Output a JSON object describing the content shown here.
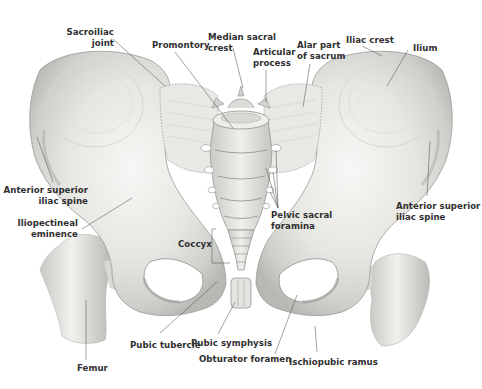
{
  "diagram": {
    "colors": {
      "bone_light": "#f4f4f2",
      "bone_mid": "#d9d9d6",
      "bone_shadow": "#a8a8a4",
      "outline": "#8a8a86",
      "label_text": "#2f2f2f",
      "leader_line": "#555555",
      "background": "#ffffff"
    },
    "labels": [
      {
        "id": "sacroiliac-joint",
        "text": "Sacroiliac\njoint",
        "x": 114,
        "y": 27,
        "align": "r",
        "line": [
          [
            113,
            39
          ],
          [
            165,
            86
          ]
        ]
      },
      {
        "id": "promontory",
        "text": "Promontory",
        "x": 152,
        "y": 40,
        "align": "l",
        "line": [
          [
            175,
            52
          ],
          [
            233,
            128
          ]
        ]
      },
      {
        "id": "median-sacral-crest",
        "text": "Median sacral\ncrest",
        "x": 208,
        "y": 32,
        "align": "l",
        "line": [
          [
            233,
            48
          ],
          [
            243,
            88
          ]
        ]
      },
      {
        "id": "articular-process",
        "text": "Articular\nprocess",
        "x": 253,
        "y": 47,
        "align": "l",
        "line": [
          [
            266,
            70
          ],
          [
            266,
            102
          ]
        ]
      },
      {
        "id": "alar-part-of-sacrum",
        "text": "Alar part\nof sacrum",
        "x": 297,
        "y": 40,
        "align": "l",
        "line": [
          [
            310,
            64
          ],
          [
            303,
            107
          ]
        ]
      },
      {
        "id": "iliac-crest",
        "text": "Iliac crest",
        "x": 346,
        "y": 35,
        "align": "l",
        "line": [
          [
            362,
            46
          ],
          [
            382,
            56
          ]
        ]
      },
      {
        "id": "ilium",
        "text": "Ilium",
        "x": 413,
        "y": 43,
        "align": "l",
        "line": [
          [
            408,
            50
          ],
          [
            387,
            86
          ]
        ]
      },
      {
        "id": "anterior-superior-iliac-spine-left",
        "text": "Anterior superior\niliac spine",
        "x": 88,
        "y": 185,
        "align": "r",
        "line": [
          [
            53,
            182
          ],
          [
            37,
            137
          ]
        ]
      },
      {
        "id": "iliopectineal-eminence",
        "text": "Iliopectineal\neminence",
        "x": 78,
        "y": 218,
        "align": "r",
        "line": [
          [
            82,
            229
          ],
          [
            132,
            198
          ]
        ]
      },
      {
        "id": "anterior-superior-iliac-spine-right",
        "text": "Anterior superior\niliac spine",
        "x": 396,
        "y": 201,
        "align": "l",
        "line": [
          [
            427,
            196
          ],
          [
            430,
            141
          ]
        ]
      },
      {
        "id": "pelvic-sacral-foramina",
        "text": "Pelvic sacral\nforamina",
        "x": 271,
        "y": 210,
        "align": "l",
        "line": [
          [
            278,
            208
          ],
          [
            266,
            168
          ]
        ]
      },
      {
        "id": "coccyx",
        "text": "Coccyx",
        "x": 178,
        "y": 239,
        "align": "l",
        "line": [
          [
            212,
            243
          ],
          [
            220,
            243
          ]
        ]
      },
      {
        "id": "pubic-tubercle",
        "text": "Pubic tubercle",
        "x": 130,
        "y": 340,
        "align": "l",
        "line": [
          [
            160,
            333
          ],
          [
            217,
            282
          ]
        ]
      },
      {
        "id": "pubic-symphysis",
        "text": "Pubic symphysis",
        "x": 191,
        "y": 338,
        "align": "l",
        "line": [
          [
            218,
            334
          ],
          [
            235,
            302
          ]
        ]
      },
      {
        "id": "obturator-foramen",
        "text": "Obturator foramen",
        "x": 199,
        "y": 354,
        "align": "l",
        "line": [
          [
            275,
            354
          ],
          [
            297,
            295
          ]
        ]
      },
      {
        "id": "ischiopubic-ramus",
        "text": "Ischiopubic ramus",
        "x": 289,
        "y": 357,
        "align": "l",
        "line": [
          [
            317,
            352
          ],
          [
            315,
            326
          ]
        ]
      },
      {
        "id": "femur",
        "text": "Femur",
        "x": 77,
        "y": 363,
        "align": "l",
        "line": [
          [
            86,
            360
          ],
          [
            86,
            300
          ]
        ]
      }
    ]
  }
}
